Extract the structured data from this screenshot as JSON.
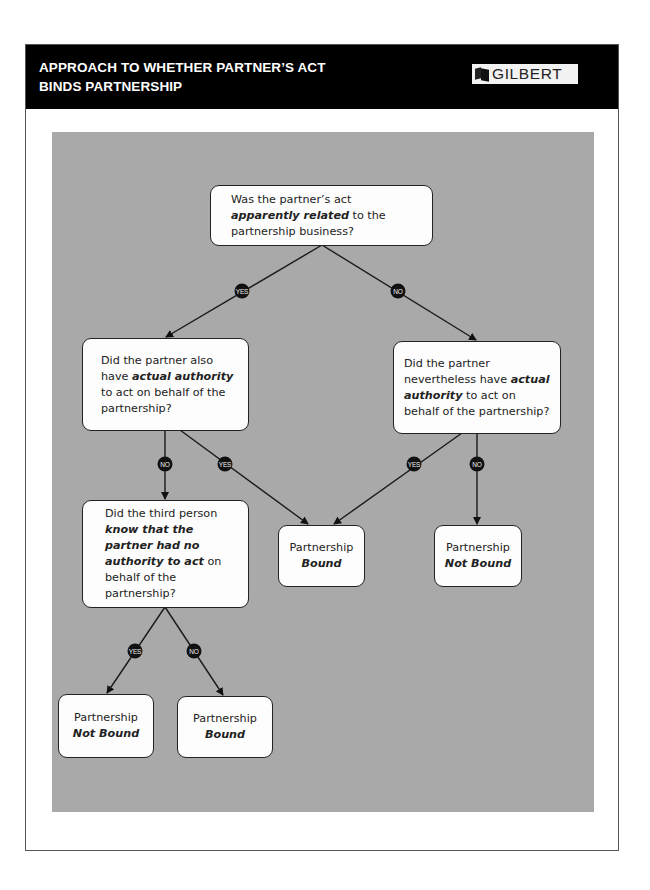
{
  "header": {
    "title": "APPROACH TO WHETHER PARTNER’S ACT\nBINDS PARTNERSHIP",
    "logo_text": "GILBERT",
    "logo_icon": "book-icon"
  },
  "colors": {
    "header_bg": "#000000",
    "panel_bg": "#a9a9a9",
    "node_bg": "#fdfdfd",
    "badge_bg": "#111111"
  },
  "nodes": {
    "q1": {
      "text_before": "Was the partner’s act ",
      "emphasis": "apparently related",
      "text_after": " to the partnership business?"
    },
    "q2": {
      "text_before": "Did the partner also have ",
      "emphasis": "actual authority",
      "text_after": " to act on behalf of the partnership?"
    },
    "q3": {
      "text_before": "Did the partner nevertheless have ",
      "emphasis": "actual authority",
      "text_after": " to act on behalf of the partnership?"
    },
    "q4": {
      "text_before": "Did the third person ",
      "emphasis": "know that the partner had no authority to act",
      "text_after": " on behalf of the partnership?"
    },
    "r_bound_center": {
      "line1": "Partnership",
      "line2": "Bound"
    },
    "r_not_bound_right": {
      "line1": "Partnership",
      "line2": "Not Bound"
    },
    "r_not_bound_bottom": {
      "line1": "Partnership",
      "line2": "Not Bound"
    },
    "r_bound_bottom": {
      "line1": "Partnership",
      "line2": "Bound"
    }
  },
  "edges": [
    {
      "from": "q1",
      "to": "q2",
      "label": "YES"
    },
    {
      "from": "q1",
      "to": "q3",
      "label": "NO"
    },
    {
      "from": "q2",
      "to": "q4",
      "label": "NO"
    },
    {
      "from": "q2",
      "to": "r_bound_center",
      "label": "YES"
    },
    {
      "from": "q3",
      "to": "r_bound_center",
      "label": "YES"
    },
    {
      "from": "q3",
      "to": "r_not_bound_right",
      "label": "NO"
    },
    {
      "from": "q4",
      "to": "r_not_bound_bottom",
      "label": "YES"
    },
    {
      "from": "q4",
      "to": "r_bound_bottom",
      "label": "NO"
    }
  ],
  "badges": {
    "yes": "YES",
    "no": "NO"
  }
}
